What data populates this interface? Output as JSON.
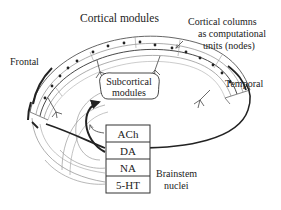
{
  "labels": {
    "cortical_modules": "Cortical modules",
    "cortical_columns_line1": "Cortical columns",
    "cortical_columns_line2": "as computational",
    "cortical_columns_line3": "units (nodes)",
    "frontal": "Frontal",
    "temporal": "Temporal",
    "subcortical_line1": "Subcortical",
    "subcortical_line2": "modules",
    "brainstem_line1": "Brainstem",
    "brainstem_line2": "nuclei"
  },
  "neuromodulators": [
    {
      "label": "ACh"
    },
    {
      "label": "DA"
    },
    {
      "label": "NA"
    },
    {
      "label": "5-HT"
    }
  ],
  "colors": {
    "ink": "#222222",
    "light_ink": "#8a8a8a",
    "background": "#ffffff"
  }
}
